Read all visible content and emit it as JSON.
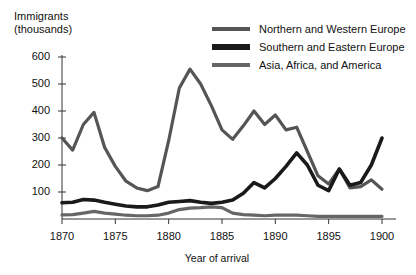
{
  "chart_data": {
    "type": "line",
    "title": "",
    "ylabel": "Immigrants\n(thousands)",
    "xlabel": "Year of arrival",
    "xlim": [
      1870,
      1900
    ],
    "ylim": [
      0,
      600
    ],
    "yticks": [
      0,
      100,
      200,
      300,
      400,
      500,
      600
    ],
    "ytick_labels": [
      "",
      "100",
      "200",
      "300",
      "400",
      "500",
      "600"
    ],
    "xticks": [
      1870,
      1875,
      1880,
      1885,
      1890,
      1895,
      1900
    ],
    "xtick_labels": [
      "1870",
      "1875",
      "1880",
      "1885",
      "1890",
      "1895",
      "1900"
    ],
    "grid": false,
    "legend_position": "top-right",
    "x": [
      1870,
      1871,
      1872,
      1873,
      1874,
      1875,
      1876,
      1877,
      1878,
      1879,
      1880,
      1881,
      1882,
      1883,
      1884,
      1885,
      1886,
      1887,
      1888,
      1889,
      1890,
      1891,
      1892,
      1893,
      1894,
      1895,
      1896,
      1897,
      1898,
      1899,
      1900
    ],
    "series": [
      {
        "name": "Northern and Western Europe",
        "color": "#555555",
        "width": 3.2,
        "values": [
          300,
          255,
          350,
          395,
          265,
          195,
          140,
          115,
          105,
          120,
          290,
          485,
          555,
          500,
          420,
          330,
          295,
          345,
          400,
          350,
          385,
          330,
          340,
          250,
          160,
          130,
          185,
          115,
          120,
          145,
          110
        ]
      },
      {
        "name": "Southern and Eastern Europe",
        "color": "#1a1a1a",
        "width": 3.6,
        "values": [
          60,
          62,
          72,
          70,
          62,
          55,
          48,
          45,
          45,
          52,
          62,
          65,
          68,
          62,
          58,
          62,
          70,
          95,
          135,
          115,
          150,
          195,
          245,
          200,
          125,
          105,
          185,
          125,
          135,
          200,
          300
        ]
      },
      {
        "name": "Asia, Africa, and America",
        "color": "#666666",
        "width": 3.2,
        "values": [
          15,
          16,
          22,
          28,
          22,
          18,
          14,
          12,
          12,
          14,
          22,
          35,
          40,
          42,
          45,
          42,
          22,
          16,
          14,
          12,
          14,
          14,
          14,
          12,
          10,
          10,
          10,
          10,
          10,
          10,
          10
        ]
      }
    ]
  }
}
